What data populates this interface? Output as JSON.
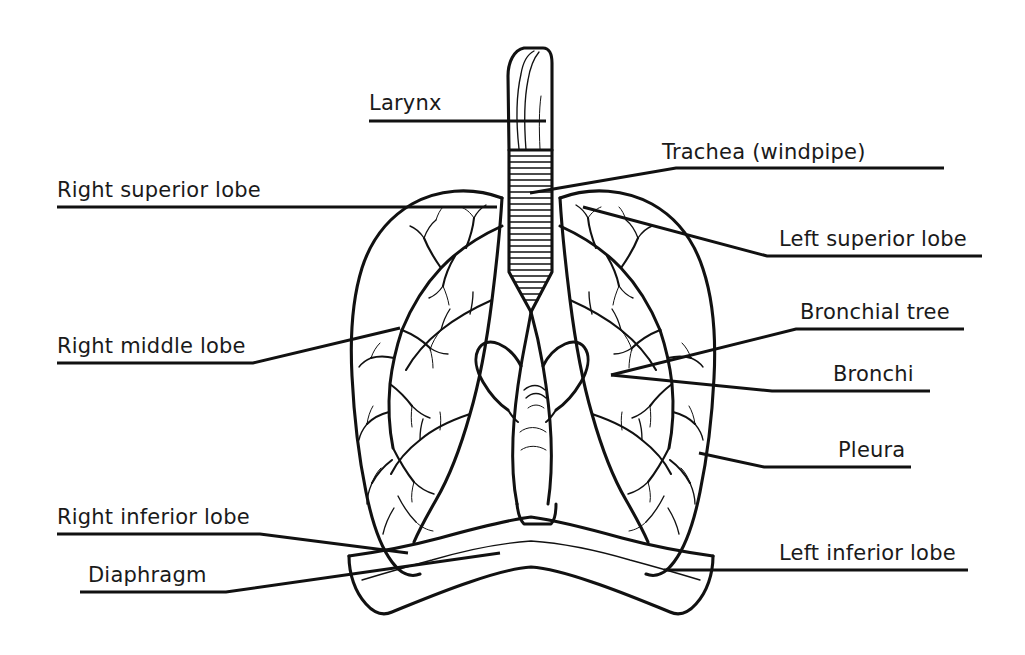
{
  "diagram": {
    "background_color": "#ffffff",
    "line_color": "#111111",
    "text_color": "#1a1a1a"
  },
  "labels": [
    {
      "id": "larynx",
      "text": "Larynx"
    },
    {
      "id": "trachea",
      "text": "Trachea (windpipe)"
    },
    {
      "id": "right-superior-lobe",
      "text": "Right superior lobe"
    },
    {
      "id": "left-superior-lobe",
      "text": "Left superior lobe"
    },
    {
      "id": "right-middle-lobe",
      "text": "Right middle lobe"
    },
    {
      "id": "bronchial-tree",
      "text": "Bronchial tree"
    },
    {
      "id": "bronchi",
      "text": "Bronchi"
    },
    {
      "id": "pleura",
      "text": "Pleura"
    },
    {
      "id": "right-inferior-lobe",
      "text": "Right inferior lobe"
    },
    {
      "id": "left-inferior-lobe",
      "text": "Left inferior lobe"
    },
    {
      "id": "diaphragm",
      "text": "Diaphragm"
    }
  ],
  "structures": [
    {
      "id": "larynx",
      "name": "Larynx"
    },
    {
      "id": "trachea",
      "name": "Trachea (windpipe)"
    },
    {
      "id": "right-lung",
      "name": "Right lung"
    },
    {
      "id": "left-lung",
      "name": "Left lung"
    },
    {
      "id": "bronchial-tree",
      "name": "Bronchial tree"
    },
    {
      "id": "diaphragm",
      "name": "Diaphragm"
    }
  ]
}
